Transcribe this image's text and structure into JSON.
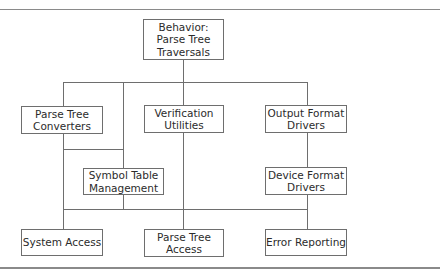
{
  "diagram": {
    "type": "module hierarchy",
    "nodes": [
      {
        "id": "behavior",
        "label": "Behavior:\nParse Tree\nTraversals"
      },
      {
        "id": "converters",
        "label": "Parse Tree\nConverters"
      },
      {
        "id": "verification",
        "label": "Verification\nUtilities"
      },
      {
        "id": "output",
        "label": "Output Format\nDrivers"
      },
      {
        "id": "symbol",
        "label": "Symbol Table\nManagement"
      },
      {
        "id": "device",
        "label": "Device Format\nDrivers"
      },
      {
        "id": "system",
        "label": "System Access"
      },
      {
        "id": "ptaccess",
        "label": "Parse Tree\nAccess"
      },
      {
        "id": "error",
        "label": "Error Reporting"
      }
    ],
    "edges": [
      [
        "behavior",
        "converters"
      ],
      [
        "behavior",
        "symbol"
      ],
      [
        "behavior",
        "verification"
      ],
      [
        "behavior",
        "output"
      ],
      [
        "converters",
        "symbol"
      ],
      [
        "converters",
        "system"
      ],
      [
        "verification",
        "ptaccess"
      ],
      [
        "output",
        "device"
      ],
      [
        "device",
        "error"
      ],
      [
        "symbol",
        "system"
      ],
      [
        "symbol",
        "ptaccess"
      ],
      [
        "symbol",
        "error"
      ]
    ]
  },
  "colors": {
    "line": "#6e6e6e",
    "rule": "#8a8a8a",
    "text": "#2b2b2b"
  }
}
